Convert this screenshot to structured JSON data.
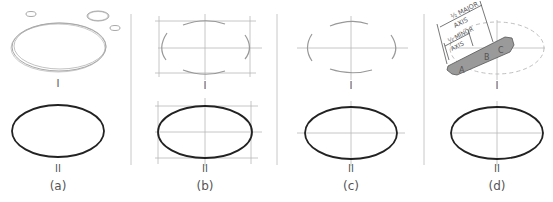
{
  "panels": [
    {
      "id": "a",
      "caption": "(a)",
      "step1": "I",
      "step2": "II"
    },
    {
      "id": "b",
      "caption": "(b)",
      "step1": "I",
      "step2": "II"
    },
    {
      "id": "c",
      "caption": "(c)",
      "step1": "I",
      "step2": "II"
    },
    {
      "id": "d",
      "caption": "(d)",
      "step1": "I",
      "step2": "II"
    }
  ],
  "trammel": {
    "major_label_line1": "½ MAJOR",
    "major_label_line2": "AXIS",
    "minor_label_line1": "½ MINOR",
    "minor_label_line2": "AXIS",
    "points": [
      "A",
      "B",
      "C"
    ]
  },
  "colors": {
    "ellipse_stroke": "#222222",
    "construction": "#b8b8b8",
    "sketch": "#a8a8a8",
    "divider": "#c8c8c8",
    "trammel_fill": "#9a9a9a",
    "label": "#555555"
  }
}
